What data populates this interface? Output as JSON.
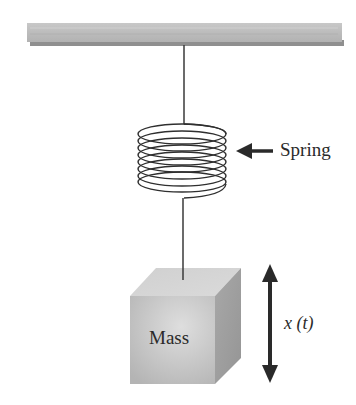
{
  "diagram": {
    "labels": {
      "spring": "Spring",
      "mass": "Mass",
      "displacement": "x (t)"
    },
    "components": [
      {
        "name": "ceiling",
        "shape": "horizontal-bar"
      },
      {
        "name": "upper-string",
        "shape": "line"
      },
      {
        "name": "spring",
        "shape": "coil",
        "turns": 8
      },
      {
        "name": "lower-string",
        "shape": "line"
      },
      {
        "name": "mass",
        "shape": "cube"
      },
      {
        "name": "spring-pointer-arrow",
        "shape": "left-arrow"
      },
      {
        "name": "displacement-arrow",
        "shape": "double-headed-vertical-arrow"
      }
    ],
    "colors": {
      "ceiling": "#bdbdbd",
      "ceiling_shadow": "#8f8f8f",
      "line": "#3a3a3a",
      "mass_front": "#c4c4c4",
      "mass_top": "#d6d6d6",
      "mass_side": "#a0a0a0",
      "arrow": "#2a2a2a"
    }
  }
}
